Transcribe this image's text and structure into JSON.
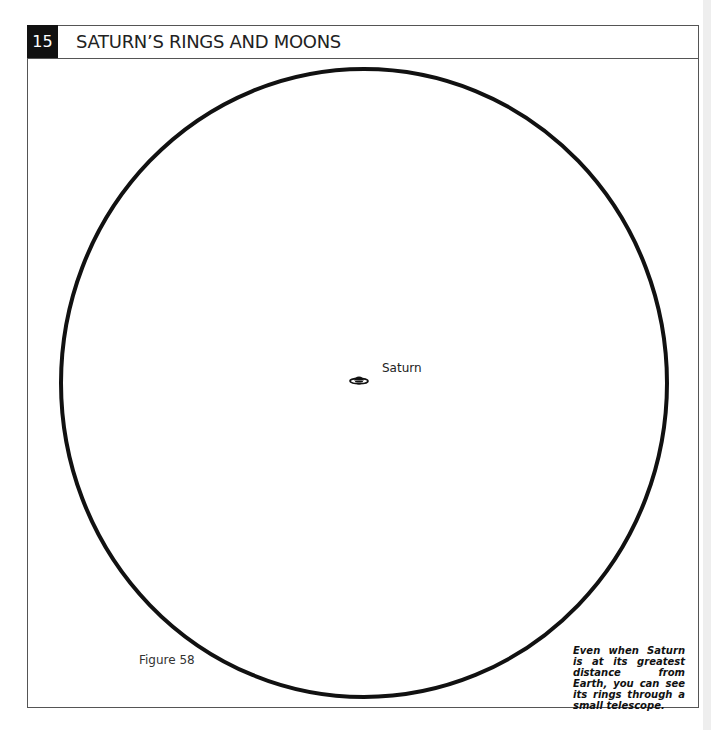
{
  "header": {
    "chapter_number": "15",
    "title": "SATURN’S RINGS AND MOONS"
  },
  "figure": {
    "label": "Figure 58",
    "field_of_view_circle": {
      "cx": 364,
      "cy": 383,
      "rx": 303,
      "ry": 314,
      "stroke": "#111111"
    },
    "objects": [
      {
        "name": "Saturn",
        "label": "Saturn",
        "icon": "saturn-icon"
      }
    ]
  },
  "caption": "Even when Saturn is at its greatest distance from Earth, you can see its rings through a small telescope."
}
